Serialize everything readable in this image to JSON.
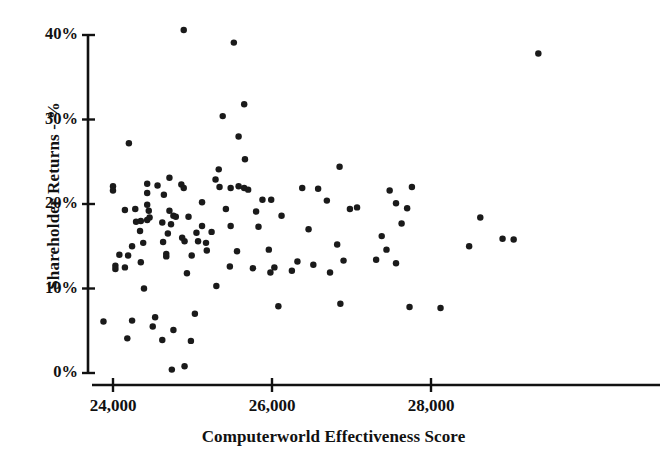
{
  "chart_data": {
    "type": "scatter",
    "title": "",
    "xlabel": "Computerworld Effectiveness Score",
    "ylabel": "Shareholder Returns - %",
    "xlim": [
      23750,
      29600
    ],
    "ylim": [
      -1,
      41
    ],
    "grid": false,
    "legend": null,
    "xticks": [
      24000,
      26000,
      28000
    ],
    "xtick_labels": [
      "24,000",
      "26,000",
      "28,000"
    ],
    "yticks": [
      0,
      10,
      20,
      30,
      40
    ],
    "ytick_labels": [
      "0%",
      "10%",
      "20%",
      "30%",
      "40%"
    ],
    "marker": {
      "shape": "circle",
      "color": "#1a1a1a",
      "size": 5
    },
    "axis_color": "#111111",
    "background": "#ffffff",
    "n_points": 118,
    "points": [
      {
        "x": 24890,
        "y": 40.6
      },
      {
        "x": 25520,
        "y": 39.1
      },
      {
        "x": 29350,
        "y": 37.8
      },
      {
        "x": 25650,
        "y": 31.8
      },
      {
        "x": 25380,
        "y": 30.4
      },
      {
        "x": 24200,
        "y": 27.2
      },
      {
        "x": 25580,
        "y": 28.0
      },
      {
        "x": 25660,
        "y": 25.3
      },
      {
        "x": 26850,
        "y": 24.4
      },
      {
        "x": 25330,
        "y": 24.1
      },
      {
        "x": 24710,
        "y": 23.1
      },
      {
        "x": 25290,
        "y": 22.9
      },
      {
        "x": 24000,
        "y": 22.1
      },
      {
        "x": 24000,
        "y": 21.6
      },
      {
        "x": 24430,
        "y": 22.4
      },
      {
        "x": 24430,
        "y": 21.3
      },
      {
        "x": 24860,
        "y": 22.3
      },
      {
        "x": 24890,
        "y": 21.9
      },
      {
        "x": 25340,
        "y": 22.0
      },
      {
        "x": 25480,
        "y": 21.9
      },
      {
        "x": 25650,
        "y": 21.9
      },
      {
        "x": 25580,
        "y": 22.1
      },
      {
        "x": 25700,
        "y": 21.7
      },
      {
        "x": 27480,
        "y": 21.6
      },
      {
        "x": 27760,
        "y": 22.0
      },
      {
        "x": 24640,
        "y": 21.1
      },
      {
        "x": 24280,
        "y": 19.4
      },
      {
        "x": 24430,
        "y": 19.9
      },
      {
        "x": 24450,
        "y": 19.2
      },
      {
        "x": 24150,
        "y": 19.3
      },
      {
        "x": 24710,
        "y": 19.2
      },
      {
        "x": 25420,
        "y": 19.4
      },
      {
        "x": 25800,
        "y": 19.1
      },
      {
        "x": 26980,
        "y": 19.4
      },
      {
        "x": 27560,
        "y": 20.1
      },
      {
        "x": 27700,
        "y": 19.5
      },
      {
        "x": 25880,
        "y": 20.5
      },
      {
        "x": 25990,
        "y": 20.5
      },
      {
        "x": 24430,
        "y": 18.1
      },
      {
        "x": 24460,
        "y": 18.4
      },
      {
        "x": 24760,
        "y": 18.6
      },
      {
        "x": 24790,
        "y": 18.5
      },
      {
        "x": 24950,
        "y": 18.5
      },
      {
        "x": 26120,
        "y": 18.6
      },
      {
        "x": 28620,
        "y": 18.4
      },
      {
        "x": 24620,
        "y": 17.8
      },
      {
        "x": 24730,
        "y": 17.6
      },
      {
        "x": 25120,
        "y": 17.4
      },
      {
        "x": 25830,
        "y": 17.3
      },
      {
        "x": 27630,
        "y": 17.7
      },
      {
        "x": 24340,
        "y": 16.8
      },
      {
        "x": 24690,
        "y": 16.5
      },
      {
        "x": 25050,
        "y": 16.6
      },
      {
        "x": 27380,
        "y": 16.2
      },
      {
        "x": 24380,
        "y": 15.4
      },
      {
        "x": 24630,
        "y": 15.5
      },
      {
        "x": 24900,
        "y": 15.6
      },
      {
        "x": 26820,
        "y": 15.2
      },
      {
        "x": 28480,
        "y": 15.0
      },
      {
        "x": 29040,
        "y": 15.8
      },
      {
        "x": 24080,
        "y": 14.0
      },
      {
        "x": 24190,
        "y": 13.9
      },
      {
        "x": 24670,
        "y": 14.1
      },
      {
        "x": 24670,
        "y": 13.8
      },
      {
        "x": 25180,
        "y": 14.5
      },
      {
        "x": 25960,
        "y": 14.6
      },
      {
        "x": 27440,
        "y": 14.6
      },
      {
        "x": 24240,
        "y": 15.0
      },
      {
        "x": 24030,
        "y": 12.7
      },
      {
        "x": 24030,
        "y": 12.3
      },
      {
        "x": 24350,
        "y": 13.1
      },
      {
        "x": 26320,
        "y": 13.2
      },
      {
        "x": 27310,
        "y": 13.4
      },
      {
        "x": 27560,
        "y": 13.0
      },
      {
        "x": 25470,
        "y": 12.6
      },
      {
        "x": 26030,
        "y": 12.5
      },
      {
        "x": 26250,
        "y": 12.1
      },
      {
        "x": 25980,
        "y": 11.9
      },
      {
        "x": 24930,
        "y": 11.8
      },
      {
        "x": 25300,
        "y": 10.3
      },
      {
        "x": 24390,
        "y": 10.0
      },
      {
        "x": 26080,
        "y": 7.9
      },
      {
        "x": 26860,
        "y": 8.2
      },
      {
        "x": 27730,
        "y": 7.8
      },
      {
        "x": 25030,
        "y": 7.0
      },
      {
        "x": 23880,
        "y": 6.1
      },
      {
        "x": 24240,
        "y": 6.2
      },
      {
        "x": 24530,
        "y": 6.6
      },
      {
        "x": 24500,
        "y": 5.5
      },
      {
        "x": 24760,
        "y": 5.1
      },
      {
        "x": 24180,
        "y": 4.1
      },
      {
        "x": 24620,
        "y": 3.9
      },
      {
        "x": 24980,
        "y": 3.8
      },
      {
        "x": 24740,
        "y": 0.4
      },
      {
        "x": 24900,
        "y": 0.8
      },
      {
        "x": 25120,
        "y": 20.2
      },
      {
        "x": 26380,
        "y": 21.9
      },
      {
        "x": 26580,
        "y": 21.8
      },
      {
        "x": 26460,
        "y": 17.0
      },
      {
        "x": 26900,
        "y": 13.3
      },
      {
        "x": 26520,
        "y": 12.8
      },
      {
        "x": 25760,
        "y": 12.4
      },
      {
        "x": 24560,
        "y": 22.2
      },
      {
        "x": 24870,
        "y": 16.0
      },
      {
        "x": 25240,
        "y": 16.7
      },
      {
        "x": 25560,
        "y": 14.4
      },
      {
        "x": 24150,
        "y": 12.5
      },
      {
        "x": 24350,
        "y": 18.0
      },
      {
        "x": 24290,
        "y": 17.9
      },
      {
        "x": 25070,
        "y": 15.6
      },
      {
        "x": 25170,
        "y": 15.4
      },
      {
        "x": 26730,
        "y": 11.9
      },
      {
        "x": 27070,
        "y": 19.6
      },
      {
        "x": 28120,
        "y": 7.7
      },
      {
        "x": 28900,
        "y": 15.9
      },
      {
        "x": 26690,
        "y": 20.4
      },
      {
        "x": 25480,
        "y": 17.4
      },
      {
        "x": 24990,
        "y": 13.9
      }
    ]
  },
  "axis": {
    "y_label": "Shareholder Returns - %",
    "x_label": "Computerworld Effectiveness Score",
    "y_ticks": [
      "40%",
      "30%",
      "20%",
      "10%",
      "0%"
    ],
    "x_ticks": [
      "24,000",
      "26,000",
      "28,000"
    ]
  }
}
